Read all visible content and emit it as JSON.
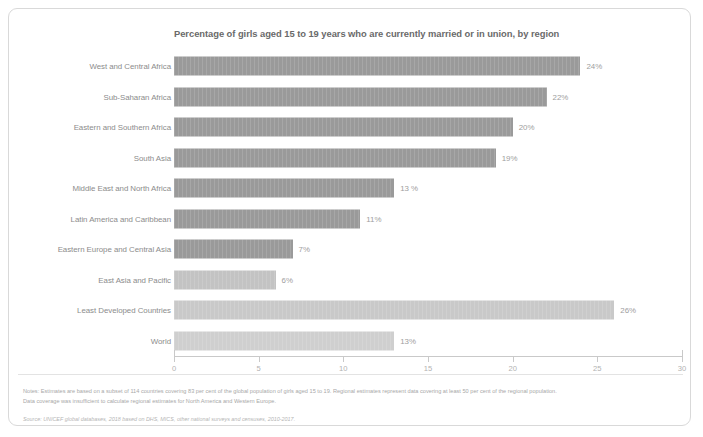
{
  "chart_data": {
    "type": "bar",
    "orientation": "horizontal",
    "title": "Percentage of girls aged 15 to 19 years who are currently married or in union, by region",
    "xlabel": "",
    "ylabel": "",
    "xlim": [
      0,
      30
    ],
    "xticks": [
      "0",
      "5",
      "10",
      "15",
      "20",
      "25",
      "30"
    ],
    "grid": false,
    "legend": "none",
    "categories": [
      "West and Central Africa",
      "Sub-Saharan Africa",
      "Eastern and Southern Africa",
      "South Asia",
      "Middle East and North Africa",
      "Latin America and Caribbean",
      "Eastern Europe and Central Asia",
      "East Asia and Pacific",
      "Least Developed Countries",
      "World"
    ],
    "values": [
      24,
      22,
      20,
      19,
      13,
      11,
      7,
      6,
      26,
      13
    ],
    "value_labels": [
      "24%",
      "22%",
      "20%",
      "19%",
      "13 %",
      "11%",
      "7%",
      "6%",
      "26%",
      "13%"
    ],
    "bar_colors": [
      "#9a9a9a",
      "#9a9a9a",
      "#9a9a9a",
      "#9a9a9a",
      "#9a9a9a",
      "#9a9a9a",
      "#9a9a9a",
      "#c3c3c3",
      "#c9c9c9",
      "#cfcfcf"
    ]
  },
  "footnotes": {
    "line1": "Notes: Estimates are based on a subset of 114 countries covering 83 per cent of the global population of girls aged 15 to 19. Regional estimates represent data covering at least 50 per cent of the regional population.",
    "line2": "Data coverage was insufficient to calculate regional estimates for North America and Western Europe.",
    "source": "Source: UNICEF global databases, 2018 based on DHS, MICS, other national surveys and censuses, 2010-2017."
  },
  "colors": {
    "bar_primary": "#9a9a9a",
    "bar_light": "#cfcfcf",
    "text_muted": "#8c8c8c",
    "card_border": "#d9d9d9"
  }
}
